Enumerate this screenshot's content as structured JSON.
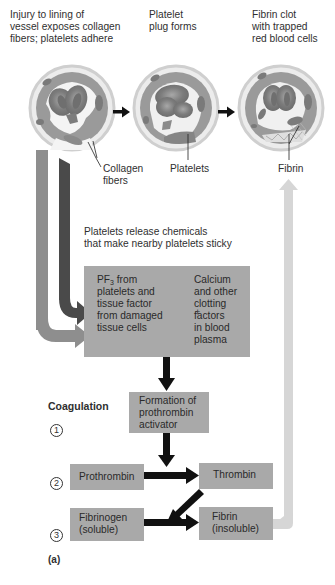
{
  "stages": [
    {
      "id": "injury",
      "label_lines": [
        "Injury to lining of",
        "vessel exposes collagen",
        "fibers; platelets adhere"
      ],
      "callout": [
        "Collagen",
        "fibers"
      ]
    },
    {
      "id": "plug",
      "label_lines": [
        "Platelet",
        "plug forms"
      ],
      "callout": [
        "Platelets"
      ]
    },
    {
      "id": "clot",
      "label_lines": [
        "Fibrin clot",
        "with trapped",
        "red blood cells"
      ],
      "callout": [
        "Fibrin"
      ]
    }
  ],
  "release_note": [
    "Platelets release chemicals",
    "that make nearby platelets sticky"
  ],
  "factors_box": {
    "left_lines": [
      "PF",
      "platelets and",
      "tissue factor",
      "from damaged",
      "tissue cells"
    ],
    "left_first_suffix": " from",
    "pf_subscript": "3",
    "plus": "+",
    "right_lines": [
      "Calcium",
      "and other",
      "clotting",
      "factors",
      "in blood",
      "plasma"
    ]
  },
  "coagulation": {
    "heading": "Coagulation",
    "steps": [
      {
        "number": "1",
        "symbol": "①"
      },
      {
        "number": "2",
        "symbol": "②"
      },
      {
        "number": "3",
        "symbol": "③"
      }
    ],
    "boxes": {
      "activator": [
        "Formation of",
        "prothrombin",
        "activator"
      ],
      "prothrombin": [
        "Prothrombin"
      ],
      "thrombin": [
        "Thrombin"
      ],
      "fibrinogen": [
        "Fibrinogen",
        "(soluble)"
      ],
      "fibrin": [
        "Fibrin",
        "(insoluble)"
      ]
    }
  },
  "panel_label": "(a)",
  "colors": {
    "box_fill": "#a9a9a9",
    "arrow_dark": "#4a4a4a",
    "arrow_mid": "#8e8e8e",
    "arrow_light": "#d6d6d6",
    "arrow_black": "#111111",
    "vessel_wall": "#b8b8b8",
    "cell": "#8a8a8a"
  }
}
